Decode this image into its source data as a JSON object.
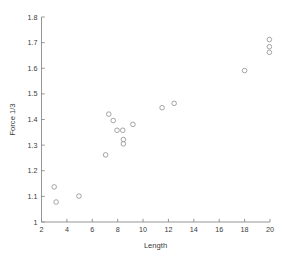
{
  "chart_data": {
    "type": "scatter",
    "title": "",
    "xlabel": "Length",
    "ylabel": "Force 1/3",
    "xlim": [
      2,
      20
    ],
    "ylim": [
      1,
      1.8
    ],
    "grid": false,
    "legend": null,
    "marker": "open-circle",
    "marker_color": "#9a9a9a",
    "xticks": [
      2,
      4,
      6,
      8,
      10,
      12,
      14,
      16,
      18,
      20
    ],
    "xtick_labels": [
      "2",
      "4",
      "6",
      "8",
      "10",
      "12",
      "14",
      "16",
      "18",
      "20"
    ],
    "yticks": [
      1,
      1.1,
      1.2,
      1.3,
      1.4,
      1.5,
      1.6,
      1.7,
      1.8
    ],
    "ytick_labels": [
      "1",
      "1.1",
      "1.2",
      "1.3",
      "1.4",
      "1.5",
      "1.6",
      "1.7",
      "1.8"
    ],
    "points": [
      {
        "x": 3.0,
        "y": 1.137
      },
      {
        "x": 3.15,
        "y": 1.078
      },
      {
        "x": 4.95,
        "y": 1.101
      },
      {
        "x": 7.05,
        "y": 1.262
      },
      {
        "x": 7.3,
        "y": 1.421
      },
      {
        "x": 7.65,
        "y": 1.396
      },
      {
        "x": 7.95,
        "y": 1.358
      },
      {
        "x": 8.4,
        "y": 1.358
      },
      {
        "x": 8.45,
        "y": 1.322
      },
      {
        "x": 8.45,
        "y": 1.305
      },
      {
        "x": 9.2,
        "y": 1.381
      },
      {
        "x": 11.5,
        "y": 1.446
      },
      {
        "x": 12.45,
        "y": 1.463
      },
      {
        "x": 18.0,
        "y": 1.591
      },
      {
        "x": 19.95,
        "y": 1.712
      },
      {
        "x": 19.95,
        "y": 1.684
      },
      {
        "x": 19.95,
        "y": 1.662
      }
    ],
    "x": [
      3.0,
      3.15,
      4.95,
      7.05,
      7.3,
      7.65,
      7.95,
      8.4,
      8.45,
      8.45,
      9.2,
      11.5,
      12.45,
      18.0,
      19.95,
      19.95,
      19.95
    ],
    "y": [
      1.137,
      1.078,
      1.101,
      1.262,
      1.421,
      1.396,
      1.358,
      1.358,
      1.322,
      1.305,
      1.381,
      1.446,
      1.463,
      1.591,
      1.712,
      1.684,
      1.662
    ]
  }
}
